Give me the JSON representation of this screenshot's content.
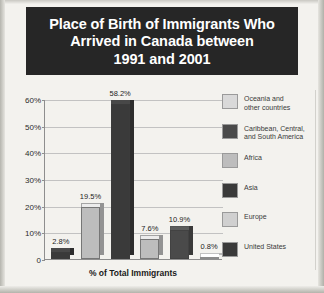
{
  "title": {
    "lines": [
      "Place of Birth of Immigrants Who",
      "Arrived in Canada between",
      "1991 and 2001"
    ]
  },
  "chart_data": {
    "type": "bar",
    "title": "Place of Birth of Immigrants Who Arrived in Canada between 1991 and 2001",
    "xlabel": "% of Total Immigrants",
    "ylabel": "",
    "ylim": [
      0,
      60
    ],
    "ytick_labels": [
      "60%",
      "50%",
      "40%",
      "30%",
      "20%",
      "10%",
      "0"
    ],
    "ytick_values": [
      60,
      50,
      40,
      30,
      20,
      10,
      0
    ],
    "grid": true,
    "legend_position": "right",
    "categories": [
      "United States",
      "Europe",
      "Asia",
      "Africa",
      "Caribbean, Central, and South America",
      "Oceania and other countries"
    ],
    "values": [
      2.8,
      19.5,
      58.2,
      7.6,
      10.9,
      0.8
    ],
    "value_labels": [
      "2.8%",
      "19.5%",
      "58.2%",
      "7.6%",
      "10.9%",
      "0.8%"
    ],
    "bar_colors": [
      "#3a3a3a",
      "#bdbdbd",
      "#3a3a3a",
      "#bdbdbd",
      "#4a4a4a",
      "#eaeaea"
    ]
  },
  "legend": {
    "items": [
      {
        "label": "Oceania and\nother countries",
        "color": "#d9d9d9"
      },
      {
        "label": "Caribbean, Central,\nand South America",
        "color": "#4a4a4a"
      },
      {
        "label": "Africa",
        "color": "#bdbdbd"
      },
      {
        "label": "Asia",
        "color": "#3a3a3a"
      },
      {
        "label": "Europe",
        "color": "#d0d0d0"
      },
      {
        "label": "United States",
        "color": "#3a3a3a"
      }
    ]
  },
  "axis": {
    "x_title": "% of Total Immigrants"
  }
}
